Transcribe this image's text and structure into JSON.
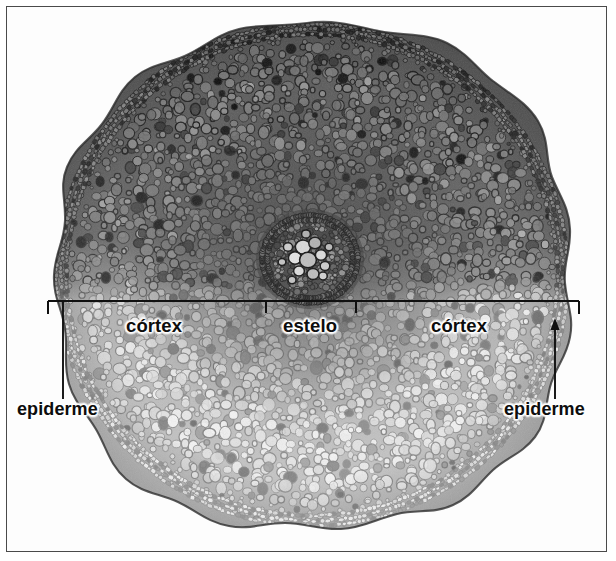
{
  "figure": {
    "kind": "biology-micrograph",
    "frame_color": "#4a4a4a",
    "background_color": "#ffffff",
    "annotation_color": "#0d0d0d",
    "annotation_halo_color": "#ffffff"
  },
  "labels": {
    "cortex_left": "córtex",
    "cortex_right": "córtex",
    "estelo": "estelo",
    "epiderme_left": "epiderme",
    "epiderme_right": "epiderme"
  },
  "annotations": {
    "bracket": {
      "description": "horizontal measuring line across the section with downward end ticks and two inner ticks bounding the stele",
      "y": 294,
      "x_start": 41,
      "x_end": 572,
      "tick_positions": [
        41,
        259,
        349,
        572
      ]
    },
    "leaders": {
      "epiderme_left": {
        "type": "line",
        "x": 56,
        "y_top": 294,
        "y_bottom": 392
      },
      "epiderme_right": {
        "type": "arrow",
        "x": 548,
        "y_top": 318,
        "y_bottom": 392,
        "arrowhead": "up"
      }
    }
  },
  "tissues": [
    {
      "name": "epiderme",
      "description": "camada externa de células pequenas e regulares"
    },
    {
      "name": "córtex",
      "description": "parênquima cortical de células arredondadas"
    },
    {
      "name": "estelo",
      "description": "cilindro vascular central com xilema e floema"
    }
  ],
  "ghost_text": [
    {
      "text": "a  de",
      "x": 30,
      "y": 66
    },
    {
      "text": "nhas",
      "x": 36,
      "y": 126
    },
    {
      "text": "e o",
      "x": 28,
      "y": 186
    },
    {
      "text": "m as",
      "x": 34,
      "y": 246
    },
    {
      "text": "te",
      "x": 24,
      "y": 306
    },
    {
      "text": "ra",
      "x": 30,
      "y": 366
    },
    {
      "text": "lh",
      "x": 26,
      "y": 426
    },
    {
      "text": "m",
      "x": 33,
      "y": 486
    },
    {
      "text": "de um",
      "x": 512,
      "y": 62
    },
    {
      "text": "ra a",
      "x": 520,
      "y": 122
    },
    {
      "text": "os",
      "x": 526,
      "y": 182
    },
    {
      "text": "nte",
      "x": 518,
      "y": 242
    },
    {
      "text": "ca",
      "x": 530,
      "y": 302
    },
    {
      "text": "me",
      "x": 524,
      "y": 362
    },
    {
      "text": "si",
      "x": 534,
      "y": 422
    },
    {
      "text": "ar",
      "x": 528,
      "y": 482
    }
  ]
}
